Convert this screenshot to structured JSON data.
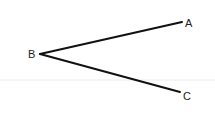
{
  "diagram": {
    "type": "angle",
    "vertex": {
      "label": "B",
      "x": 40,
      "y": 54
    },
    "points": [
      {
        "label": "A",
        "x": 182,
        "y": 22
      },
      {
        "label": "C",
        "x": 180,
        "y": 92
      }
    ],
    "segments": [
      {
        "from": "B",
        "to": "A"
      },
      {
        "from": "B",
        "to": "C"
      }
    ],
    "line_color": "#111111",
    "label_color": "#222222",
    "guide_line_color": "#ececec"
  }
}
